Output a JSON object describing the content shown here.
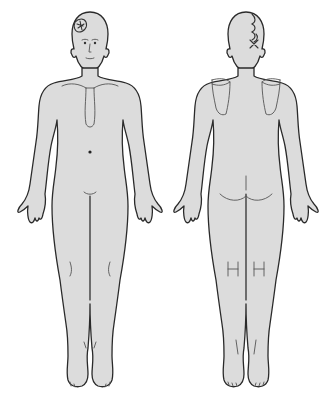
{
  "diagram": {
    "type": "body-chart",
    "views": [
      {
        "id": "anterior",
        "label": "Front view",
        "annotations": [
          "marked lesion area on right forehead/temple"
        ]
      },
      {
        "id": "posterior",
        "label": "Back view",
        "annotations": [
          "cross-hatched / sutured line on back of scalp"
        ]
      }
    ],
    "colors": {
      "background": "#ffffff",
      "skin_fill": "#dcdcdc",
      "outline": "#2a2a2a",
      "detail": "#555555"
    }
  }
}
